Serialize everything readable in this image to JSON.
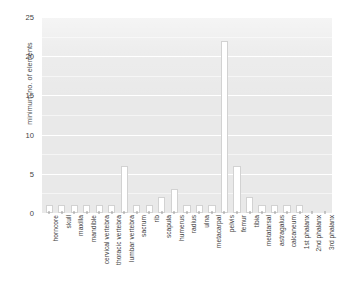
{
  "chart_data": {
    "type": "bar",
    "title": "",
    "xlabel": "",
    "ylabel": "minimum no. of elements",
    "ylim": [
      0,
      25
    ],
    "yticks": [
      0,
      5,
      10,
      15,
      20,
      25
    ],
    "grid": true,
    "legend": "none",
    "categories": [
      "horncore",
      "skull",
      "maxilla",
      "mandible",
      "cervical vertebra",
      "thoracic vertebra",
      "lumbar vertebra",
      "sacrum",
      "rib",
      "scapula",
      "humerus",
      "radius",
      "ulna",
      "metacarpal",
      "pelvis",
      "femur",
      "tibia",
      "metatarsal",
      "astragalus",
      "calcaneum",
      "1st phalanx",
      "2nd phalanx",
      "3rd phalanx"
    ],
    "values": [
      1,
      1,
      1,
      1,
      1,
      1,
      6,
      1,
      1,
      2,
      3,
      1,
      1,
      1,
      22,
      6,
      2,
      1,
      1,
      1,
      1,
      0,
      0
    ]
  },
  "style": {
    "plot_background": "#e9e9e9",
    "gridline_color": "#ffffff",
    "bar_fill": "#ffffff",
    "bar_edge": "#d2d2d2",
    "text_color": "#3f3f3f",
    "page_background": "#ffffff"
  }
}
